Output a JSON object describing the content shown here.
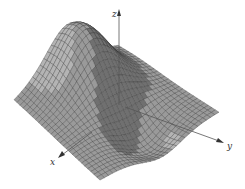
{
  "figure": {
    "type": "3d-surface-plot",
    "background": "#ffffff",
    "surface_fill": "#9a9a9a",
    "surface_fill_light": "#b4b4b4",
    "surface_fill_dark": "#707070",
    "mesh_color": "#3a3a3a",
    "axis_color": "#555555"
  },
  "axes": {
    "x": {
      "label": "x"
    },
    "y": {
      "label": "y"
    },
    "z": {
      "label": "z"
    }
  },
  "chart_data": {
    "type": "surface",
    "title": "",
    "xlabel": "x",
    "ylabel": "y",
    "zlabel": "z",
    "grid": true,
    "mesh_resolution": [
      28,
      28
    ]
  }
}
